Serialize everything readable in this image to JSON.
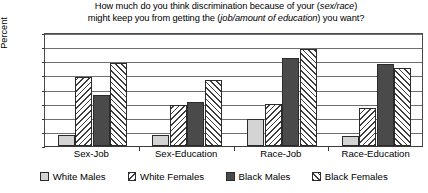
{
  "chart_data": {
    "type": "bar",
    "title": "How much do you think discrimination because of your (sex/race) might keep you from getting the (job/amount of education) you want?",
    "title_line1_pre": "How much do you think discrimination because of your (",
    "title_line1_italic": "sex/race",
    "title_line1_post": ")",
    "title_line2_pre": "might keep you from getting the (",
    "title_line2_italic": "job/amount of education",
    "title_line2_post": ") you want?",
    "xlabel": "",
    "ylabel": "Percent",
    "ylim": [
      0,
      80
    ],
    "yticks": [
      80,
      70,
      60,
      50,
      40,
      30,
      20,
      10,
      0
    ],
    "grid": true,
    "legend_position": "bottom",
    "categories": [
      "Sex-Job",
      "Sex-Education",
      "Race-Job",
      "Race-Education"
    ],
    "series": [
      {
        "name": "White Males",
        "pattern": "solid-light",
        "color": "#d4d4d4",
        "values": [
          8,
          8,
          19,
          7
        ]
      },
      {
        "name": "White Females",
        "pattern": "backslash-hatch",
        "color": "#ffffff",
        "values": [
          49,
          29,
          30,
          27
        ]
      },
      {
        "name": "Black Males",
        "pattern": "solid-dark",
        "color": "#4a4a4a",
        "values": [
          36,
          31,
          62,
          58
        ]
      },
      {
        "name": "Black Females",
        "pattern": "forwardslash-hatch",
        "color": "#ffffff",
        "values": [
          59,
          47,
          69,
          55
        ]
      }
    ]
  }
}
